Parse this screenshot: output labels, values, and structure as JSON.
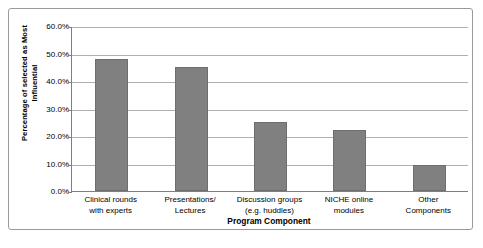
{
  "chart_data": {
    "type": "bar",
    "title": "",
    "xlabel": "Program Component",
    "ylabel": "Percentage of selected as Most Influential",
    "categories": [
      "Clinical rounds with experts",
      "Presentations/ Lectures",
      "Discussion groups (e.g. huddles)",
      "NICHE online modules",
      "Other Components"
    ],
    "category_lines": [
      [
        "Clinical rounds",
        "with experts"
      ],
      [
        "Presentations/",
        "Lectures"
      ],
      [
        "Discussion groups",
        "(e.g. huddles)"
      ],
      [
        "NICHE online",
        "modules"
      ],
      [
        "Other",
        "Components"
      ]
    ],
    "values": [
      48.0,
      45.2,
      25.0,
      22.2,
      9.5
    ],
    "ylim": [
      0,
      60
    ],
    "ytick_values": [
      0,
      10,
      20,
      30,
      40,
      50,
      60
    ],
    "ytick_labels": [
      "0.0%",
      "10.0%",
      "20.0%",
      "30.0%",
      "40.0%",
      "50.0%",
      "60.0%"
    ],
    "grid": true,
    "legend": "none",
    "bar_color": "#808080",
    "gridline_color": "#b0b0b0",
    "axis_color": "#7f7f7f",
    "background_color": "#ffffff",
    "border_color": "#9a9a9a"
  },
  "yaxis": {
    "title_line1": "Percentage of selected as Most",
    "title_line2": "Influential"
  },
  "xaxis": {
    "title": "Program Component"
  }
}
